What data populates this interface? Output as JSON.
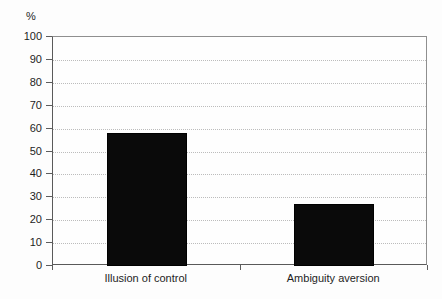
{
  "chart_data": {
    "type": "bar",
    "title": "",
    "subtitle": "",
    "xlabel": "",
    "ylabel": "%",
    "unit_label": "%",
    "categories": [
      "Illusion of control",
      "Ambiguity aversion"
    ],
    "values": [
      58,
      27
    ],
    "series": [
      {
        "name": "",
        "values": [
          58,
          27
        ]
      }
    ],
    "ylim": [
      0,
      100
    ],
    "ytick_labels": [
      "100",
      "90",
      "80",
      "70",
      "60",
      "50",
      "40",
      "30",
      "20",
      "10",
      "0"
    ],
    "ytick_values": [
      100,
      90,
      80,
      70,
      60,
      50,
      40,
      30,
      20,
      10,
      0
    ],
    "grid": true,
    "grid_axis": "y",
    "legend": false,
    "legend_position": "none",
    "bar_color": "#0a0a0a",
    "grid_color": "#bcbcbc",
    "axis_color": "#5d5d5d",
    "frame_color": "#8f8f8f",
    "background_color": "#fdfdfd",
    "plot_background_color": "#fefefe",
    "annotations": []
  }
}
